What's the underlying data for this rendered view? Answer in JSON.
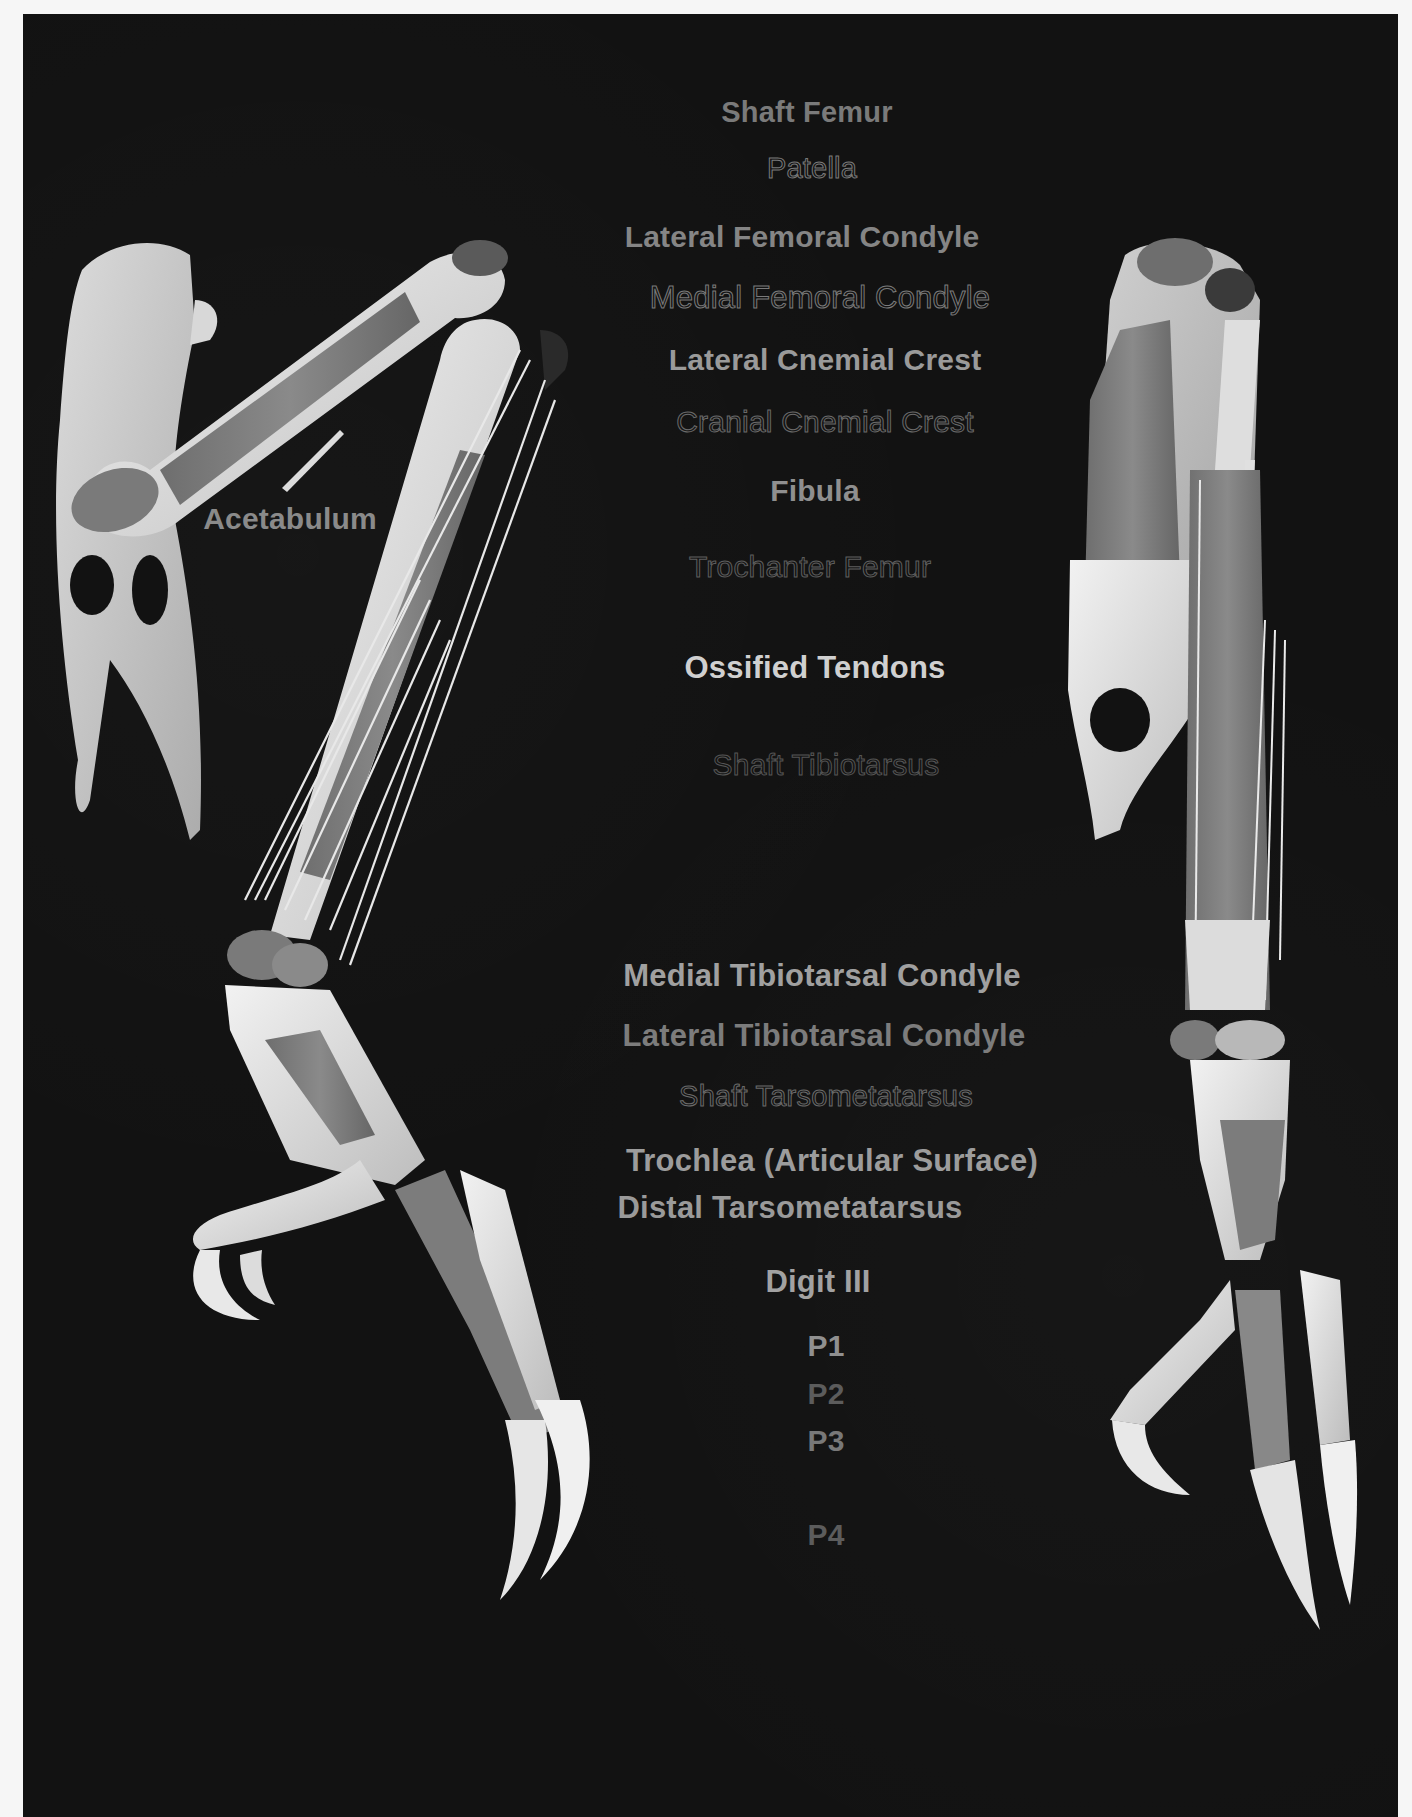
{
  "figure": {
    "colors": {
      "background": "#121212",
      "page_border": "#f6f6f6",
      "bone": "#e4e4e4",
      "highlighted_bone": "#7c7c7c",
      "label_bright": "#d0d0d0",
      "label_mid": "#8a8a8a",
      "label_dim": "#5c5c5c"
    }
  },
  "views": {
    "left": {
      "name": "Lateral view"
    },
    "right": {
      "name": "Cranial view"
    }
  },
  "labels": {
    "acetabulum": "Acetabulum",
    "shaft_femur": "Shaft Femur",
    "patella": "Patella",
    "lateral_femoral_condyle": "Lateral Femoral Condyle",
    "medial_femoral_condyle": "Medial Femoral Condyle",
    "lateral_cnemial_crest": "Lateral Cnemial Crest",
    "cranial_cnemial_crest": "Cranial Cnemial Crest",
    "fibula": "Fibula",
    "trochanter_femur": "Trochanter Femur",
    "ossified_tendons": "Ossified Tendons",
    "shaft_tibiotarsus": "Shaft Tibiotarsus",
    "medial_tibiotarsal_condyle": "Medial Tibiotarsal Condyle",
    "lateral_tibiotarsal_condyle": "Lateral Tibiotarsal Condyle",
    "shaft_tarsometatarsus": "Shaft Tarsometatarsus",
    "trochlea": "Trochlea (Articular Surface)",
    "distal_tarsometatarsus": "Distal Tarsometatarsus",
    "digit_iii": "Digit III",
    "p1": "P1",
    "p2": "P2",
    "p3": "P3",
    "p4": "P4"
  }
}
